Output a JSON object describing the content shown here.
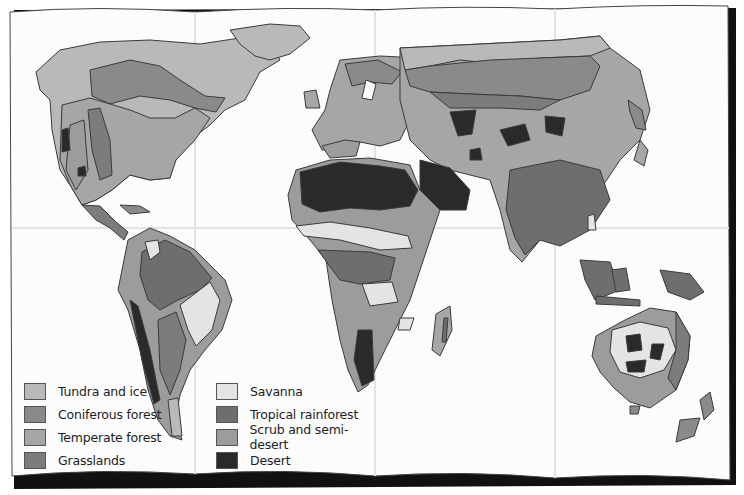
{
  "map": {
    "title": "World vegetation / biome map",
    "style": "grayscale folded poster",
    "fold_lines": {
      "vertical_x": [
        195,
        375,
        555
      ],
      "horizontal_y": [
        228
      ]
    }
  },
  "legend": {
    "items": [
      {
        "id": "tundra",
        "label": "Tundra and ice",
        "color": "#b9b9b9"
      },
      {
        "id": "coniferous",
        "label": "Coniferous forest",
        "color": "#8a8a8a"
      },
      {
        "id": "temperate",
        "label": "Temperate forest",
        "color": "#a6a6a6"
      },
      {
        "id": "grasslands",
        "label": "Grasslands",
        "color": "#7c7c7c"
      },
      {
        "id": "savanna",
        "label": "Savanna",
        "color": "#e4e4e4"
      },
      {
        "id": "tropical",
        "label": "Tropical rainforest",
        "color": "#6e6e6e"
      },
      {
        "id": "scrub",
        "label": "Scrub and semi-desert",
        "color": "#9c9c9c"
      },
      {
        "id": "desert",
        "label": "Desert",
        "color": "#2a2a2a"
      }
    ]
  }
}
